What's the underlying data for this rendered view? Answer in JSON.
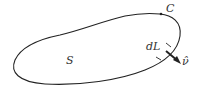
{
  "diagram": {
    "labels": {
      "curve": "C",
      "surface": "S",
      "element": "dL",
      "normal": "ν̂"
    },
    "colors": {
      "stroke": "#222222",
      "text": "#333333",
      "background": "#ffffff"
    }
  }
}
